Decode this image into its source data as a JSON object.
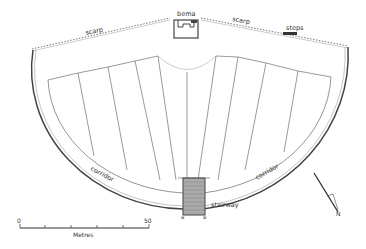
{
  "diagram": {
    "type": "architectural-plan",
    "labels": {
      "scarp_left": "scarp",
      "bema": "bema",
      "scarp_right": "scarp",
      "steps": "steps",
      "corridor_left": "corridor",
      "corridor_right": "corridor",
      "stairway": "stairway"
    },
    "scale_bar": {
      "start_label": "0",
      "end_label": "50",
      "unit_label": "Metres",
      "ticks": 5
    },
    "north_arrow": {
      "label": "N"
    },
    "colors": {
      "line": "#333333",
      "light_line": "#999999",
      "fill_dark": "#444444",
      "stair_fill": "#aaaaaa"
    }
  }
}
